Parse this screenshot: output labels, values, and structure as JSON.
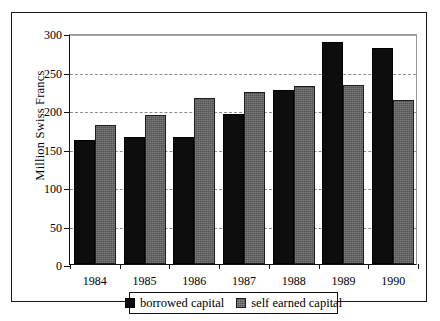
{
  "chart_data": {
    "type": "bar",
    "title": "",
    "xlabel": "",
    "ylabel": "Million Swiss Francs",
    "categories": [
      "1984",
      "1985",
      "1986",
      "1987",
      "1988",
      "1989",
      "1990"
    ],
    "series": [
      {
        "name": "borrowed capital",
        "color": "#0d0d0d",
        "values": [
          161,
          165,
          165,
          195,
          226,
          288,
          281
        ]
      },
      {
        "name": "self earned capital",
        "color": "#545454",
        "values": [
          180,
          194,
          216,
          223,
          231,
          233,
          213
        ]
      }
    ],
    "ylim": [
      0,
      300
    ],
    "yticks": [
      0,
      50,
      100,
      150,
      200,
      250,
      300
    ],
    "ytick_labels": [
      "0",
      "50",
      "100",
      "150",
      "200",
      "250",
      "300"
    ],
    "grid": true,
    "grid_axis": "y",
    "grid_style": "dashed",
    "legend_position": "bottom-center",
    "legend_entries": [
      "borrowed capital",
      "self earned capital"
    ],
    "bar_mode": "grouped"
  }
}
